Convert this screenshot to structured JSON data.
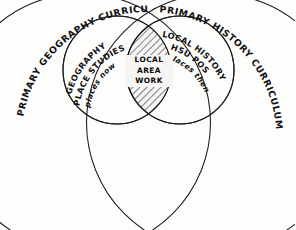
{
  "diagram": {
    "type": "venn-4-circle",
    "background_color": "#fdfdfc",
    "ink_color": "#1b1b1b",
    "sets": [
      {
        "id": "primary-geography-curriculum",
        "label": "PRIMARY GEOGRAPHY CURRICULUM",
        "role": "outer-left"
      },
      {
        "id": "primary-history-curriculum",
        "label": "PRIMARY HISTORY CURRICULUM",
        "role": "outer-right"
      },
      {
        "id": "geography-place-studies",
        "label_line1": "GEOGRAPHY",
        "label_line2": "PLACE STUDIES",
        "label_line3": "places now",
        "role": "inner-left"
      },
      {
        "id": "local-history-pos",
        "label_line1": "LOCAL HISTORY",
        "label_line2": "HSU POS",
        "label_line3": "places then",
        "role": "inner-right"
      }
    ],
    "intersection": {
      "id": "local-area-work",
      "line1": "LOCAL",
      "line2": "AREA",
      "line3": "WORK",
      "fill": "hatched"
    }
  }
}
